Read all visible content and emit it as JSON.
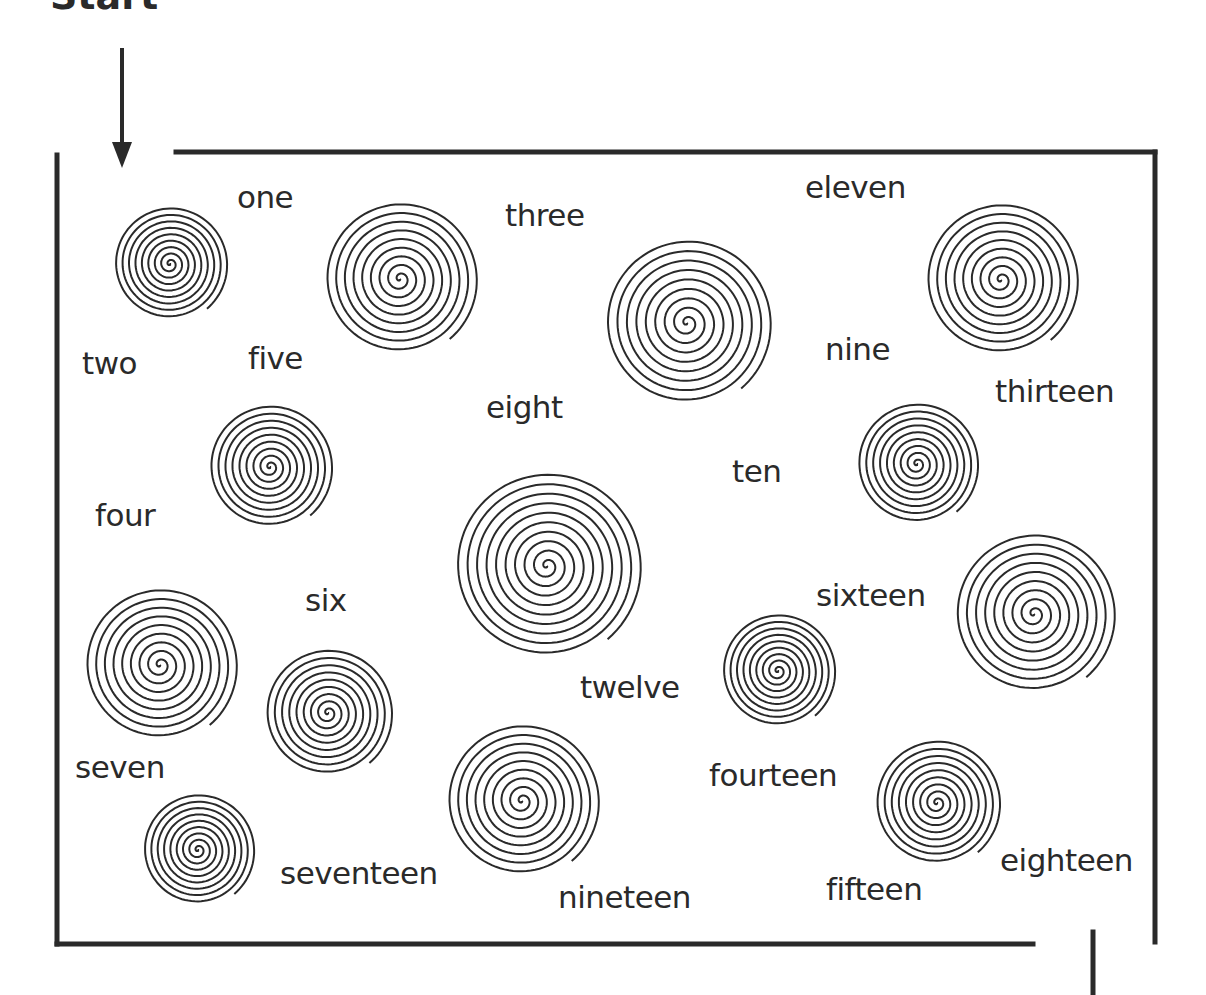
{
  "puzzle": {
    "title_fragment": "Start",
    "type": "number-word maze with spiral obstacles",
    "colors": {
      "ink": "#2a2a2a",
      "background": "#ffffff"
    },
    "border": {
      "left": 57,
      "top": 152,
      "right": 1155,
      "bottom": 944
    },
    "entrance_arrow": {
      "x": 122,
      "y_start": 48,
      "y_end": 168
    },
    "exit_line": {
      "x": 1093,
      "y_start": 930,
      "y_end": 995
    }
  },
  "labels": [
    {
      "text": "one",
      "x": 237,
      "y": 182
    },
    {
      "text": "two",
      "x": 82,
      "y": 348
    },
    {
      "text": "three",
      "x": 505,
      "y": 200
    },
    {
      "text": "four",
      "x": 95,
      "y": 500
    },
    {
      "text": "five",
      "x": 248,
      "y": 343
    },
    {
      "text": "six",
      "x": 305,
      "y": 585
    },
    {
      "text": "seven",
      "x": 75,
      "y": 752
    },
    {
      "text": "eight",
      "x": 486,
      "y": 392
    },
    {
      "text": "nine",
      "x": 825,
      "y": 334
    },
    {
      "text": "ten",
      "x": 732,
      "y": 456
    },
    {
      "text": "eleven",
      "x": 805,
      "y": 172
    },
    {
      "text": "twelve",
      "x": 580,
      "y": 672
    },
    {
      "text": "thirteen",
      "x": 995,
      "y": 376
    },
    {
      "text": "fourteen",
      "x": 709,
      "y": 760
    },
    {
      "text": "fifteen",
      "x": 826,
      "y": 874
    },
    {
      "text": "sixteen",
      "x": 816,
      "y": 580
    },
    {
      "text": "seventeen",
      "x": 280,
      "y": 858
    },
    {
      "text": "eighteen",
      "x": 1000,
      "y": 845
    },
    {
      "text": "nineteen",
      "x": 558,
      "y": 882
    }
  ],
  "spirals": [
    {
      "cx": 170,
      "cy": 264,
      "r": 58,
      "turns": 9
    },
    {
      "cx": 400,
      "cy": 279,
      "r": 78,
      "turns": 9
    },
    {
      "cx": 687,
      "cy": 323,
      "r": 85,
      "turns": 9
    },
    {
      "cx": 1001,
      "cy": 280,
      "r": 78,
      "turns": 9
    },
    {
      "cx": 270,
      "cy": 467,
      "r": 63,
      "turns": 9
    },
    {
      "cx": 547,
      "cy": 566,
      "r": 95,
      "turns": 10
    },
    {
      "cx": 917,
      "cy": 464,
      "r": 62,
      "turns": 9
    },
    {
      "cx": 160,
      "cy": 665,
      "r": 78,
      "turns": 9
    },
    {
      "cx": 328,
      "cy": 713,
      "r": 65,
      "turns": 9
    },
    {
      "cx": 778,
      "cy": 671,
      "r": 58,
      "turns": 9
    },
    {
      "cx": 1034,
      "cy": 614,
      "r": 82,
      "turns": 9
    },
    {
      "cx": 198,
      "cy": 850,
      "r": 57,
      "turns": 9
    },
    {
      "cx": 522,
      "cy": 801,
      "r": 78,
      "turns": 9
    },
    {
      "cx": 937,
      "cy": 803,
      "r": 64,
      "turns": 9
    }
  ]
}
